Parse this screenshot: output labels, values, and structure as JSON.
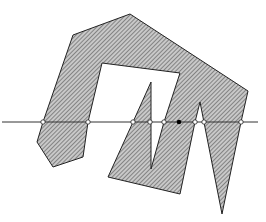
{
  "diagram": {
    "type": "point-in-polygon ray casting",
    "colors": {
      "background": "#ffffff",
      "fill": "#bdbdbd",
      "hatch": "#555555",
      "stroke": "#222222",
      "ray": "#333333",
      "open_point_fill": "#ffffff",
      "query_point_fill": "#000000"
    },
    "polygon": [
      [
        73,
        35
      ],
      [
        130,
        14
      ],
      [
        248,
        91
      ],
      [
        241,
        122
      ],
      [
        222,
        214
      ],
      [
        200,
        102
      ],
      [
        195,
        122
      ],
      [
        180,
        194
      ],
      [
        108,
        177
      ],
      [
        133,
        122
      ],
      [
        151,
        82
      ],
      [
        151,
        169
      ],
      [
        164,
        122
      ],
      [
        180,
        73
      ],
      [
        102,
        63
      ],
      [
        88,
        122
      ],
      [
        83,
        157
      ],
      [
        53,
        167
      ],
      [
        37,
        142
      ],
      [
        43,
        122
      ]
    ],
    "ray": {
      "x1": 2,
      "y": 122,
      "x2": 258
    },
    "intersections": [
      43,
      88,
      133,
      150,
      164,
      195,
      204,
      241
    ],
    "query_point": {
      "x": 179,
      "y": 122
    }
  }
}
